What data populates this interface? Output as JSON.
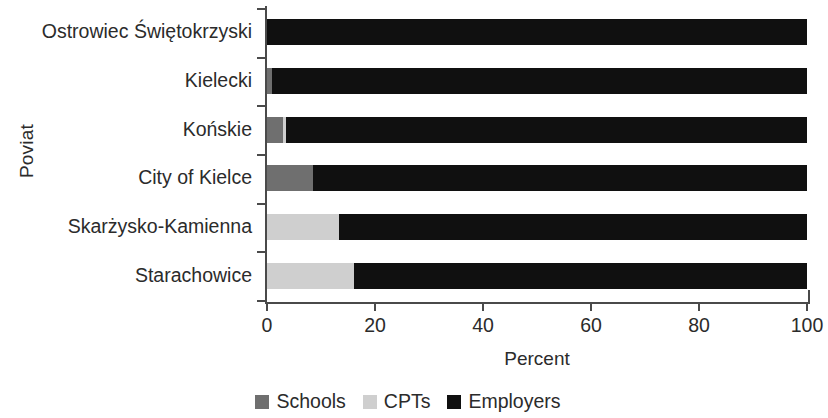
{
  "chart_data": {
    "type": "bar",
    "orientation": "horizontal",
    "stacked": true,
    "title": "",
    "xlabel": "Percent",
    "ylabel": "Poviat",
    "xlim": [
      0,
      100
    ],
    "xticks": [
      "0",
      "20",
      "40",
      "60",
      "80",
      "100"
    ],
    "xtick_values": [
      0,
      20,
      40,
      60,
      80,
      100
    ],
    "grid": false,
    "legend_position": "bottom",
    "categories": [
      "Ostrowiec Świętokrzyski",
      "Kielecki",
      "Końskie",
      "City of Kielce",
      "Skarżysko-Kamienna",
      "Starachowice"
    ],
    "series": [
      {
        "name": "Schools",
        "color": "#6f6f6f",
        "values": [
          0,
          1,
          3,
          8.5,
          0,
          0
        ]
      },
      {
        "name": "CPTs",
        "color": "#cfcfcf",
        "values": [
          0,
          0,
          0.5,
          0,
          13.3,
          16.1
        ]
      },
      {
        "name": "Employers",
        "color": "#101010",
        "values": [
          100,
          99,
          96.5,
          91.5,
          86.7,
          83.9
        ]
      }
    ]
  },
  "legend": {
    "items": [
      {
        "label": "Schools",
        "color": "#6f6f6f"
      },
      {
        "label": "CPTs",
        "color": "#cfcfcf"
      },
      {
        "label": "Employers",
        "color": "#101010"
      }
    ]
  }
}
